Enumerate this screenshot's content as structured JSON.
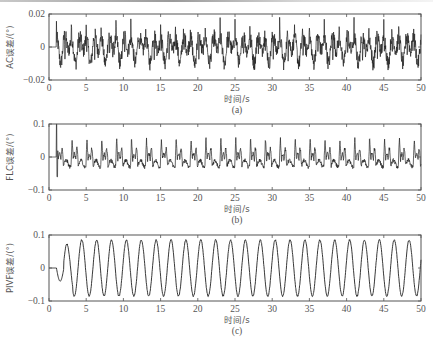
{
  "chart_data": [
    {
      "type": "line",
      "panel_label": "(a)",
      "title": "",
      "xlabel": "时间/s",
      "ylabel": "AC误差/(°)",
      "xlim": [
        0,
        50
      ],
      "ylim": [
        -0.02,
        0.02
      ],
      "x_ticks": [
        0,
        5,
        10,
        15,
        20,
        25,
        30,
        35,
        40,
        45,
        50
      ],
      "y_ticks": [
        -0.02,
        0,
        0.02
      ],
      "y_tick_labels": [
        "−0.02",
        "0",
        "0.02"
      ],
      "grid": false,
      "series": [
        {
          "name": "AC error",
          "description": "noisy periodic signal, zero until t≈1s, period ≈2s, spikes up to ≈+0.015, dips to ≈−0.015",
          "start_time": 1.0,
          "period": 2.0,
          "peak": 0.015,
          "trough": -0.015,
          "color": "#222222"
        }
      ]
    },
    {
      "type": "line",
      "panel_label": "(b)",
      "title": "",
      "xlabel": "时间/s",
      "ylabel": "FLC误差/(°)",
      "xlim": [
        0,
        50
      ],
      "ylim": [
        -0.1,
        0.1
      ],
      "x_ticks": [
        0,
        5,
        10,
        15,
        20,
        25,
        30,
        35,
        40,
        45,
        50
      ],
      "y_ticks": [
        -0.1,
        0,
        0.1
      ],
      "y_tick_labels": [
        "−0.1",
        "0",
        "0.1"
      ],
      "grid": false,
      "series": [
        {
          "name": "FLC error",
          "description": "zero until t≈1s, initial spike to +0.1 and −0.06, then periodic spikes (period ≈2s) up to ≈+0.07, baseline ≈−0.02",
          "start_time": 1.0,
          "period": 2.0,
          "initial_spike": [
            0.1,
            -0.06
          ],
          "peak": 0.07,
          "trough": -0.03,
          "color": "#222222"
        }
      ]
    },
    {
      "type": "line",
      "panel_label": "(c)",
      "title": "",
      "xlabel": "时间/s",
      "ylabel": "PIVF误差/(°)",
      "xlim": [
        0,
        50
      ],
      "ylim": [
        -0.1,
        0.1
      ],
      "x_ticks": [
        0,
        5,
        10,
        15,
        20,
        25,
        30,
        35,
        40,
        45,
        50
      ],
      "y_ticks": [
        -0.1,
        0,
        0.1
      ],
      "y_tick_labels": [
        "−0.1",
        "0",
        "0.1"
      ],
      "grid": false,
      "series": [
        {
          "name": "PIVF error",
          "description": "zero until t≈1s, dip to −0.04 at t≈1.6, then near-sinusoidal oscillation with period ≈2s, amplitude ≈0.085",
          "start_time": 1.0,
          "period": 2.0,
          "amplitude": 0.085,
          "first_dip": -0.04,
          "color": "#222222"
        }
      ]
    }
  ]
}
